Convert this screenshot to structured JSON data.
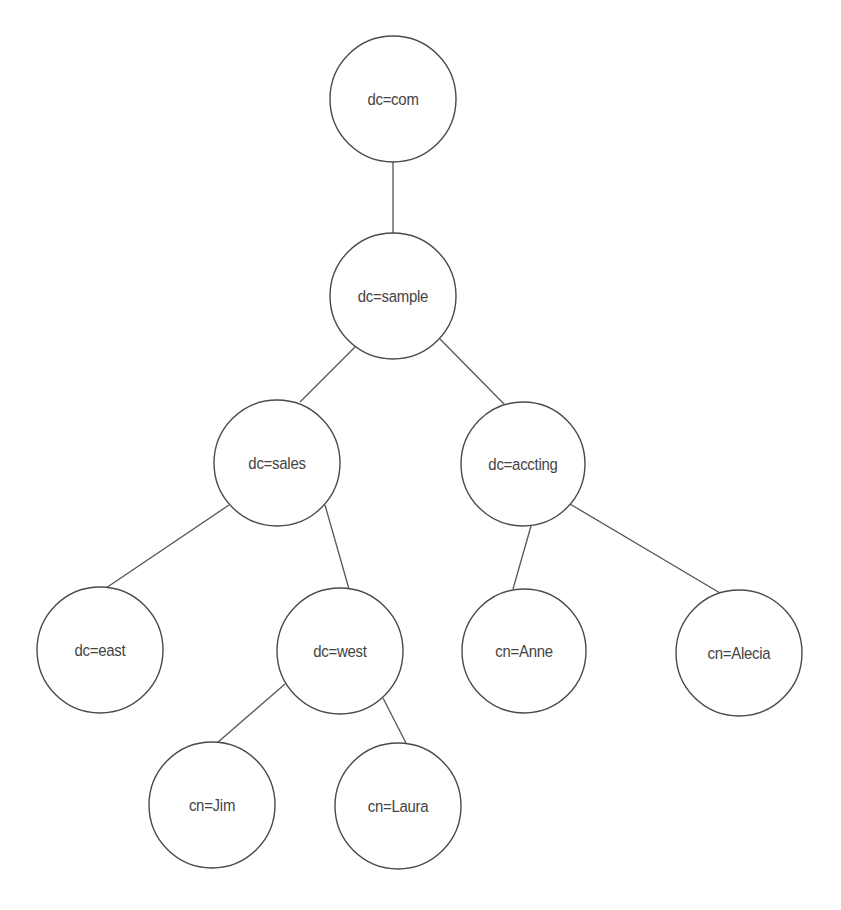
{
  "diagram": {
    "type": "tree",
    "colors": {
      "background": "#ffffff",
      "stroke": "#4a4a4a",
      "text": "#444444"
    },
    "nodes": [
      {
        "id": "com",
        "label": "dc=com",
        "cx": 393,
        "cy": 99,
        "r": 63
      },
      {
        "id": "sample",
        "label": "dc=sample",
        "cx": 393,
        "cy": 296,
        "r": 63
      },
      {
        "id": "sales",
        "label": "dc=sales",
        "cx": 277,
        "cy": 463,
        "r": 63
      },
      {
        "id": "accting",
        "label": "dc=accting",
        "cx": 523,
        "cy": 464,
        "r": 62
      },
      {
        "id": "east",
        "label": "dc=east",
        "cx": 100,
        "cy": 650,
        "r": 63
      },
      {
        "id": "west",
        "label": "dc=west",
        "cx": 340,
        "cy": 651,
        "r": 63
      },
      {
        "id": "anne",
        "label": "cn=Anne",
        "cx": 524,
        "cy": 651,
        "r": 62
      },
      {
        "id": "alecia",
        "label": "cn=Alecia",
        "cx": 739,
        "cy": 653,
        "r": 63
      },
      {
        "id": "jim",
        "label": "cn=Jim",
        "cx": 212,
        "cy": 805,
        "r": 63
      },
      {
        "id": "laura",
        "label": "cn=Laura",
        "cx": 398,
        "cy": 806,
        "r": 63
      }
    ],
    "edges": [
      {
        "from": "com",
        "to": "sample",
        "x1": 393,
        "y1": 162,
        "x2": 393,
        "y2": 233
      },
      {
        "from": "sample",
        "to": "sales",
        "x1": 355,
        "y1": 347,
        "x2": 300,
        "y2": 402
      },
      {
        "from": "sample",
        "to": "accting",
        "x1": 440,
        "y1": 339,
        "x2": 505,
        "y2": 405
      },
      {
        "from": "sales",
        "to": "east",
        "x1": 229,
        "y1": 505,
        "x2": 106,
        "y2": 588
      },
      {
        "from": "sales",
        "to": "west",
        "x1": 325,
        "y1": 505,
        "x2": 349,
        "y2": 589
      },
      {
        "from": "accting",
        "to": "anne",
        "x1": 531,
        "y1": 526,
        "x2": 513,
        "y2": 589
      },
      {
        "from": "accting",
        "to": "alecia",
        "x1": 570,
        "y1": 504,
        "x2": 720,
        "y2": 593
      },
      {
        "from": "west",
        "to": "jim",
        "x1": 285,
        "y1": 684,
        "x2": 217,
        "y2": 743
      },
      {
        "from": "west",
        "to": "laura",
        "x1": 383,
        "y1": 698,
        "x2": 406,
        "y2": 743
      }
    ]
  }
}
